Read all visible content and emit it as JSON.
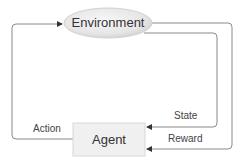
{
  "diagram": {
    "type": "reinforcement-learning-loop",
    "nodes": {
      "environment": {
        "label": "Environment",
        "shape": "ellipse"
      },
      "agent": {
        "label": "Agent",
        "shape": "rectangle"
      }
    },
    "edges": [
      {
        "from": "agent",
        "to": "environment",
        "label": "Action"
      },
      {
        "from": "environment",
        "to": "agent",
        "label": "State"
      },
      {
        "from": "environment",
        "to": "agent",
        "label": "Reward"
      }
    ],
    "colors": {
      "line": "#8a8a8a",
      "arrowhead": "#333333",
      "ellipse_fill_light": "#f4f4f4",
      "ellipse_fill_dark": "#d6d6d6",
      "agent_fill": "#f0f0f0",
      "agent_border": "#d8d8d8"
    }
  }
}
